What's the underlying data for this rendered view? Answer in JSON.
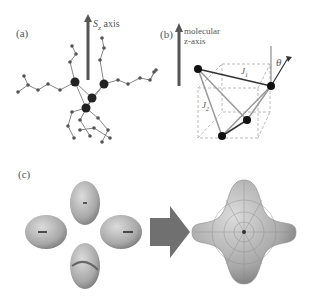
{
  "figure": {
    "panels": [
      {
        "id": "a",
        "label": "(a)",
        "axis_label_main": "S",
        "axis_label_sub": "z",
        "axis_label_suffix": " axis"
      },
      {
        "id": "b",
        "label": "(b)",
        "axis_text_line1": "molecular",
        "axis_text_line2": "z-axis",
        "coupling_1": "J",
        "coupling_1_sub": "1",
        "coupling_2": "J",
        "coupling_2_sub": "2",
        "angle": "θ"
      },
      {
        "id": "c",
        "label": "(c)"
      }
    ],
    "colors": {
      "atom": "#1a1a1a",
      "bond": "#777777",
      "arrow": "#555555",
      "surface": "#b8b8b8",
      "big_arrow": "#707070",
      "cube": "#999999"
    }
  }
}
